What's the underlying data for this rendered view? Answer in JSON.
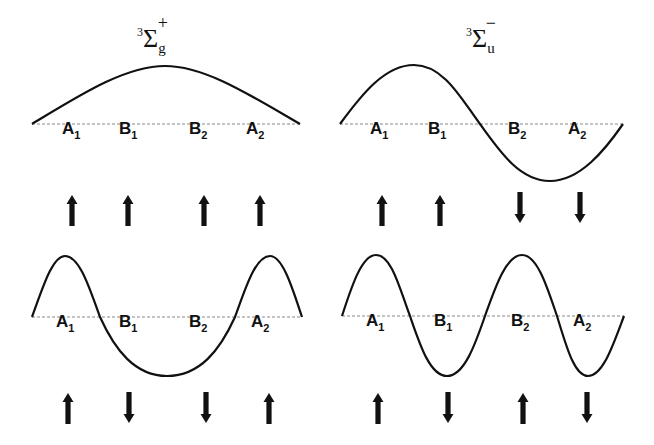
{
  "panels": [
    {
      "id": "top-left",
      "title": {
        "sup_left": "3",
        "main": "Σ",
        "sub": "g",
        "sup_right": "+"
      },
      "labels": [
        {
          "main": "A",
          "sub": "1"
        },
        {
          "main": "B",
          "sub": "1"
        },
        {
          "main": "B",
          "sub": "2"
        },
        {
          "main": "A",
          "sub": "2"
        }
      ],
      "spins": [
        "up",
        "up",
        "up",
        "up"
      ],
      "wave": "half-period arch (nodeless)"
    },
    {
      "id": "top-right",
      "title": {
        "sup_left": "3",
        "main": "Σ",
        "sub": "u",
        "sup_right": "−"
      },
      "labels": [
        {
          "main": "A",
          "sub": "1"
        },
        {
          "main": "B",
          "sub": "1"
        },
        {
          "main": "B",
          "sub": "2"
        },
        {
          "main": "A",
          "sub": "2"
        }
      ],
      "spins": [
        "up",
        "up",
        "down",
        "down"
      ],
      "wave": "one full period, single node at center"
    },
    {
      "id": "bottom-left",
      "title": null,
      "labels": [
        {
          "main": "A",
          "sub": "1"
        },
        {
          "main": "B",
          "sub": "1"
        },
        {
          "main": "B",
          "sub": "2"
        },
        {
          "main": "A",
          "sub": "2"
        }
      ],
      "spins": [
        "up",
        "down",
        "down",
        "up"
      ],
      "wave": "peak-trough-peak, two nodes"
    },
    {
      "id": "bottom-right",
      "title": null,
      "labels": [
        {
          "main": "A",
          "sub": "1"
        },
        {
          "main": "B",
          "sub": "1"
        },
        {
          "main": "B",
          "sub": "2"
        },
        {
          "main": "A",
          "sub": "2"
        }
      ],
      "spins": [
        "up",
        "down",
        "up",
        "down"
      ],
      "wave": "two full periods, three interior nodes"
    }
  ]
}
